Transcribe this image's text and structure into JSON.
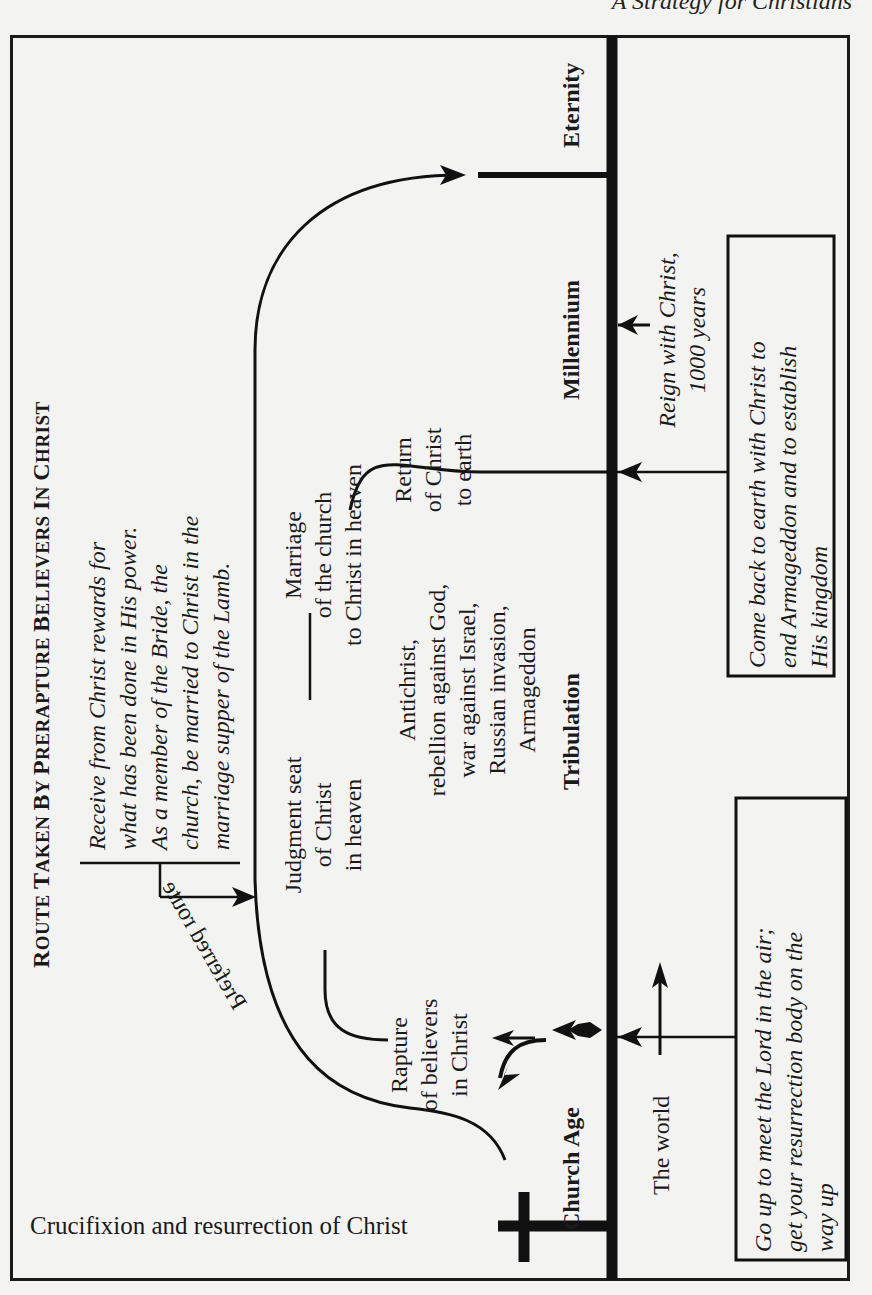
{
  "running_head": "A Strategy for Christians",
  "title": {
    "words": [
      {
        "cap": "R",
        "rest": "OUTE "
      },
      {
        "cap": "T",
        "rest": "AKEN "
      },
      {
        "cap": "B",
        "rest": "Y "
      },
      {
        "cap": "P",
        "rest": "RERAPTURE "
      },
      {
        "cap": "B",
        "rest": "ELIEVERS "
      },
      {
        "cap": "I",
        "rest": "N "
      },
      {
        "cap": "C",
        "rest": "HRIST"
      }
    ],
    "full": "Route Taken by Prerapture Believers in Christ"
  },
  "rewards_note": {
    "lines": [
      "Receive from Christ rewards for",
      "what has been done in His power.",
      "As a member of the Bride, the",
      "church, be married to Christ in the",
      "marriage supper of the Lamb."
    ]
  },
  "events": {
    "judgment_seat": [
      "Judgment seat",
      "of Christ",
      "in heaven"
    ],
    "marriage": [
      "Marriage",
      "of the church",
      "to Christ in heaven"
    ],
    "tribulation_events": [
      "Antichrist,",
      "rebellion against God,",
      "war against Israel,",
      "Russian invasion,",
      "Armageddon"
    ],
    "return": [
      "Return",
      "of Christ",
      "to earth"
    ],
    "rapture": [
      "Rapture",
      "of believers",
      "in Christ"
    ],
    "preferred_route": "Preferred route"
  },
  "timeline": {
    "crucifixion": "Crucifixion and resurrection of Christ",
    "periods": [
      "Church Age",
      "Tribulation",
      "Millennium",
      "Eternity"
    ],
    "the_world": "The world"
  },
  "boxes": {
    "rapture_box": [
      "Go up to meet the Lord in the air;",
      "get your resurrection body on the",
      "way up"
    ],
    "return_box": [
      "Come back to earth with Christ to",
      "end Armageddon and to establish",
      "His kingdom"
    ],
    "reign_note": [
      "Reign with Christ,",
      "1000 years"
    ]
  }
}
